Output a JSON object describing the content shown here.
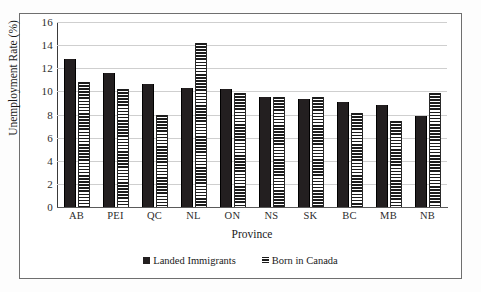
{
  "chart_data": {
    "type": "bar",
    "title": "",
    "xlabel": "Province",
    "ylabel": "Unemployment Rate (%)",
    "ylim": [
      0,
      16
    ],
    "ytick_step": 2,
    "yticks": [
      "16",
      "14",
      "12",
      "10",
      "8",
      "6",
      "4",
      "2",
      "0"
    ],
    "grid": true,
    "legend_position": "bottom",
    "categories": [
      "AB",
      "PEI",
      "QC",
      "NL",
      "ON",
      "NS",
      "SK",
      "BC",
      "MB",
      "NB"
    ],
    "series": [
      {
        "name": "Landed Immigrants",
        "style": "solid",
        "color": "#231f20",
        "values": [
          12.8,
          11.6,
          10.6,
          10.3,
          10.2,
          9.5,
          9.3,
          9.1,
          8.8,
          7.9
        ]
      },
      {
        "name": "Born in Canada",
        "style": "striped",
        "color": "#1c1c1c",
        "values": [
          10.8,
          10.2,
          8.0,
          14.2,
          9.9,
          9.5,
          9.5,
          8.1,
          7.4,
          9.9
        ]
      }
    ]
  },
  "legend": {
    "items": [
      {
        "label": "Landed Immigrants",
        "style": "solid"
      },
      {
        "label": "Born in Canada",
        "style": "striped"
      }
    ]
  }
}
